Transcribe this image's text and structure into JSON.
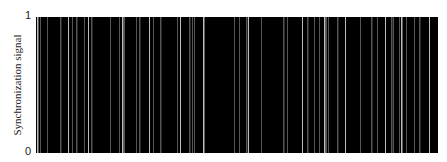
{
  "chart_data": {
    "type": "area",
    "title": "",
    "xlabel": "",
    "ylabel": "Synchronization signal",
    "yticks": [
      "0",
      "1"
    ],
    "ylim": [
      0,
      1
    ],
    "xlim": [
      0,
      1
    ],
    "grid": false,
    "legend": null,
    "signal_high_value": 1,
    "signal_low_value": 0,
    "zero_gaps_x": [
      0.002,
      0.01,
      0.027,
      0.06,
      0.08,
      0.09,
      0.1,
      0.119,
      0.129,
      0.137,
      0.184,
      0.206,
      0.214,
      0.219,
      0.249,
      0.256,
      0.281,
      0.291,
      0.308,
      0.351,
      0.358,
      0.381,
      0.388,
      0.393,
      0.415,
      0.493,
      0.505,
      0.522,
      0.527,
      0.56,
      0.614,
      0.624,
      0.662,
      0.674,
      0.692,
      0.704,
      0.716,
      0.721,
      0.726,
      0.748,
      0.768,
      0.806,
      0.833,
      0.848,
      0.868,
      0.883,
      0.888,
      0.903,
      0.908,
      0.92,
      0.94,
      0.953,
      0.978
    ],
    "gap_colors": {
      "bright": "#bdbdbd",
      "dim": "#555555"
    },
    "fill_color": "#000000"
  },
  "axis": {
    "ylabel": "Synchronization signal",
    "ytick_top": "1",
    "ytick_bottom": "0"
  }
}
